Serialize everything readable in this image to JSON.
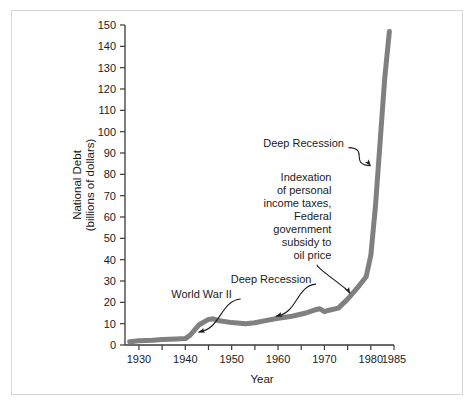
{
  "figure": {
    "background_color": "#ffffff",
    "frame_color": "#d8d8d8",
    "axis_color": "#3a3a3a",
    "line_color": "#808080",
    "text_color": "#1a1a1a"
  },
  "chart_data": {
    "type": "line",
    "title": "",
    "xlabel": "Year",
    "ylabel": "National Debt\n(billions of dollars)",
    "ylabel_line1": "National Debt",
    "ylabel_line2": "(billions of dollars)",
    "xlim": [
      1927,
      1985
    ],
    "ylim": [
      0,
      150
    ],
    "grid": false,
    "legend": "none",
    "line_color": "#808080",
    "line_width": 5,
    "ytick_labels": [
      "0",
      "10",
      "20",
      "30",
      "40",
      "50",
      "60",
      "70",
      "80",
      "90",
      "100",
      "110",
      "120",
      "130",
      "140",
      "150"
    ],
    "ytick_values": [
      0,
      10,
      20,
      30,
      40,
      50,
      60,
      70,
      80,
      90,
      100,
      110,
      120,
      130,
      140,
      150
    ],
    "xtick_values": [
      1930,
      1935,
      1940,
      1945,
      1950,
      1955,
      1960,
      1965,
      1970,
      1975,
      1980,
      1985
    ],
    "xtick_labels": [
      "1930",
      "",
      "1940",
      "",
      "1950",
      "",
      "1960",
      "",
      "1970",
      "",
      "1980",
      "1985"
    ],
    "xtick_major_labeled": [
      "1930",
      "1940",
      "1950",
      "1960",
      "1970",
      "1980",
      "1985"
    ],
    "series": [
      {
        "name": "National Debt",
        "x": [
          1928,
          1930,
          1933,
          1935,
          1938,
          1940,
          1941,
          1943,
          1945,
          1946,
          1947,
          1950,
          1953,
          1955,
          1957,
          1960,
          1963,
          1966,
          1968,
          1969,
          1970,
          1971,
          1973,
          1975,
          1977,
          1979,
          1980,
          1981,
          1982,
          1983,
          1984
        ],
        "values": [
          1.5,
          2.0,
          2.2,
          2.6,
          2.8,
          3.0,
          4.5,
          9.5,
          12.0,
          12.3,
          11.5,
          10.5,
          10.0,
          10.4,
          11.3,
          12.5,
          13.5,
          15.0,
          16.5,
          17.0,
          15.6,
          16.3,
          17.3,
          21.5,
          26.5,
          32.0,
          42.0,
          65.0,
          95.0,
          125.0,
          147.0
        ]
      }
    ],
    "annotations": [
      {
        "id": "world-war-ii",
        "text": "World War II",
        "text_x": 1943.5,
        "text_y": 22,
        "points_to_x": 1942.8,
        "points_to_y": 6.0
      },
      {
        "id": "deep-recession-lower",
        "text": "Deep Recession",
        "text_x": 1958.5,
        "text_y": 29,
        "points_to_x": 1959.5,
        "points_to_y": 13.5
      },
      {
        "id": "indexation-note",
        "lines": [
          "Indexation",
          "of personal",
          "income taxes,",
          "Federal",
          "government",
          "subsidy to",
          "oil price"
        ],
        "text_align": "right",
        "text_x": 1971.5,
        "text_y_top": 77,
        "points_to_x": 1975.5,
        "points_to_y": 24.0
      },
      {
        "id": "deep-recession-upper",
        "text": "Deep Recession",
        "text_x": 1965.5,
        "text_y": 93,
        "points_to_x": 1980.0,
        "points_to_y": 84.0
      }
    ]
  }
}
